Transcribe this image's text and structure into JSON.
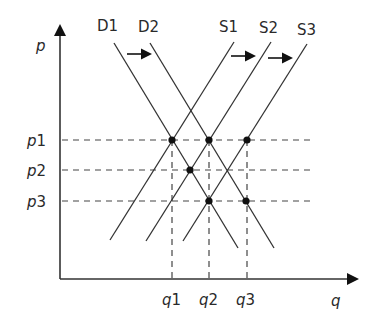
{
  "diagram": {
    "type": "supply-demand",
    "axes": {
      "y_label": "p",
      "x_label": "q"
    },
    "price_levels": [
      {
        "label": "p1",
        "y": 140
      },
      {
        "label": "p2",
        "y": 170
      },
      {
        "label": "p3",
        "y": 201
      }
    ],
    "quantity_levels": [
      {
        "label": "q1",
        "x": 172
      },
      {
        "label": "q2",
        "x": 209
      },
      {
        "label": "q3",
        "x": 247
      }
    ],
    "demand_curves": [
      {
        "label": "D1",
        "x1": 114,
        "y1": 43,
        "x2": 238,
        "y2": 248
      },
      {
        "label": "D2",
        "x1": 150,
        "y1": 43,
        "x2": 274,
        "y2": 248
      }
    ],
    "supply_curves": [
      {
        "label": "S1",
        "x1": 234,
        "y1": 42,
        "x2": 110,
        "y2": 240
      },
      {
        "label": "S2",
        "x1": 271,
        "y1": 42,
        "x2": 146,
        "y2": 241
      },
      {
        "label": "S3",
        "x1": 307,
        "y1": 44,
        "x2": 183,
        "y2": 241
      }
    ],
    "shift_arrows": [
      {
        "from": "D1",
        "to": "D2",
        "direction": "right"
      },
      {
        "from": "S1",
        "to": "S2",
        "direction": "right"
      },
      {
        "from": "S2",
        "to": "S3",
        "direction": "right"
      }
    ],
    "equilibrium_points": [
      {
        "name": "D1-S1",
        "price": "p1",
        "quantity": "q1"
      },
      {
        "name": "D2-S2",
        "price": "p1",
        "quantity": "q2"
      },
      {
        "name": "D1-S2",
        "price": "p2",
        "quantity": "between q1 and q2"
      },
      {
        "name": "D1-S3",
        "price": "p3",
        "quantity": "q2"
      },
      {
        "name": "D2-S3",
        "price": "p3",
        "quantity": "q3"
      },
      {
        "name": "S3-p1",
        "price": "p1",
        "quantity": "q3"
      }
    ]
  }
}
